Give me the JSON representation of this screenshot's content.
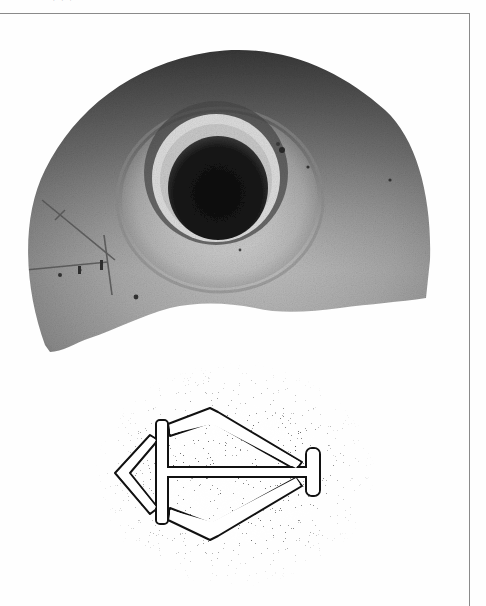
{
  "page": {
    "running_head": "· ·  ·",
    "border_color": "#8a8a8a",
    "background": "#fefefe"
  },
  "figure": {
    "photo": {
      "subject": "ceramic-vessel-fragment",
      "view": "top",
      "features": [
        "central-hole",
        "raised-collar",
        "incised-mark-left"
      ],
      "colors": {
        "body_light": "#a3a3a3",
        "body_dark": "#3a3a3a",
        "hole": "#141414"
      }
    },
    "drawing": {
      "subject": "incised-mark",
      "style": "stippled",
      "motif": "arrow-diamond-with-crossbar",
      "colors": {
        "stipple": "#1a1a1a",
        "ground": "#ffffff"
      }
    }
  }
}
